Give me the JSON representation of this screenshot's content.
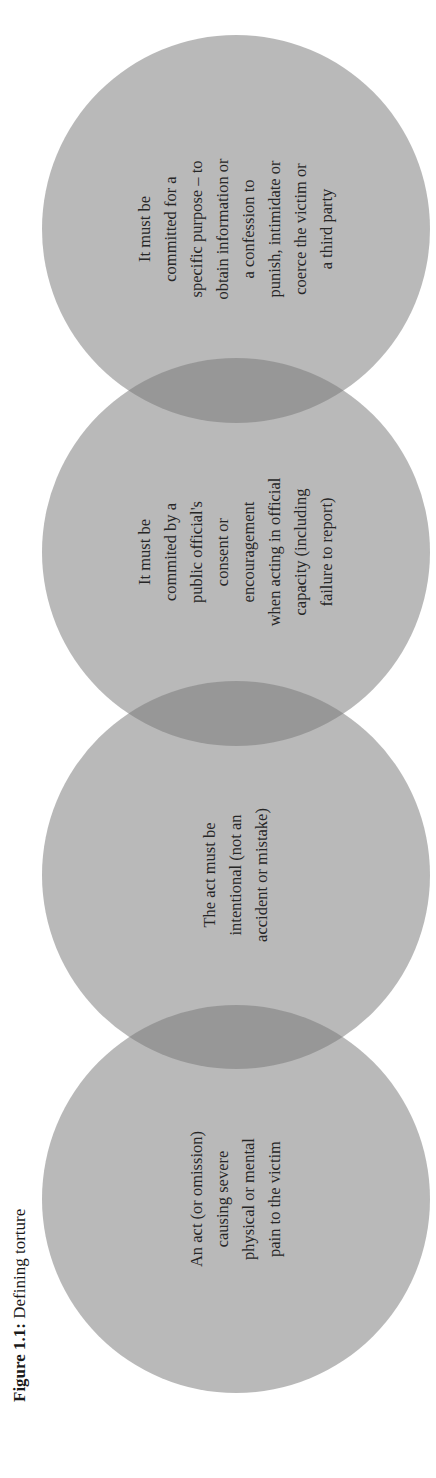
{
  "figure": {
    "caption_label": "Figure 1.1:",
    "caption_title": "Defining torture",
    "colors": {
      "circle_fill": "#b3b3b3",
      "overlap_fill": "#8f8f8f",
      "text": "#262626",
      "background": "#ffffff"
    },
    "orientation": "rotated 90° counter-clockwise",
    "circles": [
      {
        "id": 1,
        "lines": [
          "An act (or omission)",
          "causing severe",
          "physical or mental",
          "pain to the victim"
        ]
      },
      {
        "id": 2,
        "lines": [
          "The act must be",
          "intentional (not an",
          "accident or mistake)"
        ]
      },
      {
        "id": 3,
        "lines": [
          "It must be",
          "commited by a",
          "public official's",
          "consent or",
          "encouragement",
          "when acting in official",
          "capacity (including",
          "failure to report)"
        ]
      },
      {
        "id": 4,
        "lines": [
          "It must be",
          "committed for a",
          "specific purpose – to",
          "obtain information or",
          "a confession to",
          "punish, intimidate or",
          "coerce the victim or",
          "a third party"
        ]
      }
    ]
  }
}
